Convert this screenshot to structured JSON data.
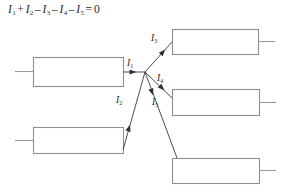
{
  "figure": {
    "equation": {
      "terms": [
        {
          "symbol": "I",
          "subscript": "1",
          "operator": ""
        },
        {
          "symbol": "I",
          "subscript": "2",
          "operator": "+"
        },
        {
          "symbol": "I",
          "subscript": "3",
          "operator": "–"
        },
        {
          "symbol": "I",
          "subscript": "4",
          "operator": "–"
        },
        {
          "symbol": "I",
          "subscript": "5",
          "operator": "–"
        }
      ],
      "equals": "=",
      "result": "0",
      "plain_text": "I1 + I2 - I3 - I4 - I5 = 0"
    },
    "colors": {
      "box_stroke": "#8f8f8f",
      "wire_stroke": "#9a9a9a",
      "arrow_line": "#3a3a3a",
      "label_text": "#222222",
      "equation_text": "#2b2b2b",
      "background": "#ffffff"
    },
    "junction": {
      "x": 145,
      "y": 72,
      "label": "junction-node"
    },
    "boxes": [
      {
        "id": "box-top-left",
        "x": 33,
        "y": 57,
        "w": 90,
        "h": 29,
        "stub_side": "left",
        "stub_x1": 15,
        "stub_x2": 33,
        "stub_y": 71
      },
      {
        "id": "box-bottom-left",
        "x": 33,
        "y": 127,
        "w": 90,
        "h": 26,
        "stub_side": "left",
        "stub_x1": 15,
        "stub_x2": 33,
        "stub_y": 140
      },
      {
        "id": "box-top-right",
        "x": 172,
        "y": 29,
        "w": 86,
        "h": 25,
        "stub_side": "right",
        "stub_x1": 258,
        "stub_x2": 275,
        "stub_y": 41
      },
      {
        "id": "box-middle-right",
        "x": 172,
        "y": 89,
        "w": 87,
        "h": 26,
        "stub_side": "right",
        "stub_x1": 259,
        "stub_x2": 276,
        "stub_y": 102
      },
      {
        "id": "box-bottom-right",
        "x": 172,
        "y": 158,
        "w": 87,
        "h": 25,
        "stub_side": "right",
        "stub_x1": 259,
        "stub_x2": 276,
        "stub_y": 170
      }
    ],
    "currents": [
      {
        "id": "current-i1",
        "symbol": "I",
        "subscript": "1",
        "direction": "into-junction",
        "label_x": 127,
        "label_y": 59,
        "line": {
          "x1": 123,
          "y1": 72,
          "x2": 145,
          "y2": 72
        },
        "arrow": {
          "x": 133,
          "y": 72,
          "angle": 0
        }
      },
      {
        "id": "current-i2",
        "symbol": "I",
        "subscript": "2",
        "direction": "into-junction",
        "label_x": 116,
        "label_y": 96,
        "line": {
          "x1": 123,
          "y1": 150,
          "x2": 145,
          "y2": 72
        },
        "arrow": {
          "x": 129,
          "y": 128,
          "angle": -74
        }
      },
      {
        "id": "current-i3",
        "symbol": "I",
        "subscript": "3",
        "direction": "out-of-junction",
        "label_x": 151,
        "label_y": 34,
        "line": {
          "x1": 145,
          "y1": 72,
          "x2": 172,
          "y2": 42
        },
        "arrow": {
          "x": 163,
          "y": 52,
          "angle": -48
        }
      },
      {
        "id": "current-i4",
        "symbol": "I",
        "subscript": "4",
        "direction": "out-of-junction",
        "label_x": 157,
        "label_y": 74,
        "line": {
          "x1": 145,
          "y1": 72,
          "x2": 172,
          "y2": 98
        },
        "arrow": {
          "x": 162,
          "y": 88,
          "angle": 44
        }
      },
      {
        "id": "current-i5",
        "symbol": "I",
        "subscript": "5",
        "direction": "out-of-junction",
        "label_x": 152,
        "label_y": 98,
        "line": {
          "x1": 145,
          "y1": 72,
          "x2": 177,
          "y2": 158
        },
        "arrow": {
          "x": 152,
          "y": 92,
          "angle": 70
        }
      }
    ]
  }
}
